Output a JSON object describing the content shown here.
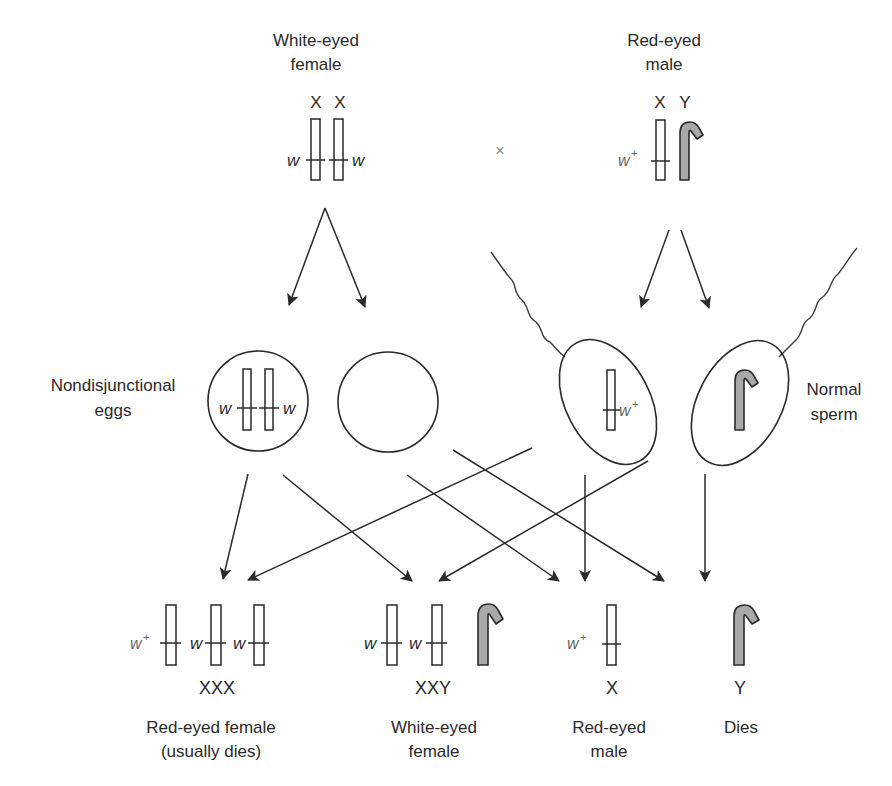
{
  "figure": {
    "type": "genetics-cross-diagram",
    "topic": "Primary nondisjunction of X chromosomes in Drosophila (white-eye locus)"
  },
  "parents": {
    "female": {
      "label_line1": "White-eyed",
      "label_line2": "female",
      "chromosome_labels": [
        "X",
        "X"
      ],
      "alleles": [
        "w",
        "w"
      ]
    },
    "cross_symbol": "×",
    "male": {
      "label_line1": "Red-eyed",
      "label_line2": "male",
      "chromosome_labels": [
        "X",
        "Y"
      ],
      "alleles": [
        "w",
        "+"
      ]
    }
  },
  "gametes": {
    "eggs": {
      "label_line1": "Nondisjunctional",
      "label_line2": "eggs",
      "egg1_alleles": [
        "w",
        "w"
      ],
      "egg2_contents": "none"
    },
    "sperm": {
      "label_line1": "Normal",
      "label_line2": "sperm",
      "sperm1_allele_base": "w",
      "sperm1_allele_sup": "+",
      "sperm2_contents": "Y"
    }
  },
  "offspring": [
    {
      "karyotype": "XXX",
      "alleles": [
        {
          "base": "w",
          "sup": "+"
        },
        {
          "base": "w",
          "sup": ""
        },
        {
          "base": "w",
          "sup": ""
        }
      ],
      "phenotype_line1": "Red-eyed female",
      "phenotype_line2": "(usually dies)"
    },
    {
      "karyotype": "XXY",
      "alleles": [
        {
          "base": "w",
          "sup": ""
        },
        {
          "base": "w",
          "sup": ""
        }
      ],
      "phenotype_line1": "White-eyed",
      "phenotype_line2": "female"
    },
    {
      "karyotype": "X",
      "alleles": [
        {
          "base": "w",
          "sup": "+"
        }
      ],
      "phenotype_line1": "Red-eyed",
      "phenotype_line2": "male"
    },
    {
      "karyotype": "Y",
      "alleles": [],
      "phenotype_line1": "Dies",
      "phenotype_line2": ""
    }
  ],
  "colors": {
    "line": "#2a2a2a",
    "y_chromosome_fill": "#a9a9a9",
    "background": "#ffffff"
  }
}
